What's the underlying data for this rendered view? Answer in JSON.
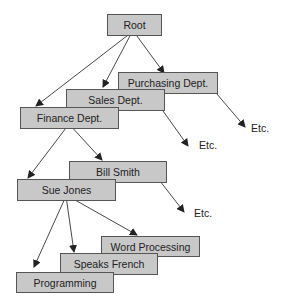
{
  "diagram": {
    "nodes": {
      "root": "Root",
      "purchasing": "Purchasing Dept.",
      "sales": "Sales Dept.",
      "finance": "Finance Dept.",
      "bill_smith": "Bill Smith",
      "sue_jones": "Sue Jones",
      "word_processing": "Word Processing",
      "speaks_french": "Speaks French",
      "programming": "Programming"
    },
    "etc_labels": [
      "Etc.",
      "Etc.",
      "Etc."
    ],
    "colors": {
      "box_fill": "#c8c8c8",
      "box_border": "#555555",
      "line": "#333333"
    }
  }
}
